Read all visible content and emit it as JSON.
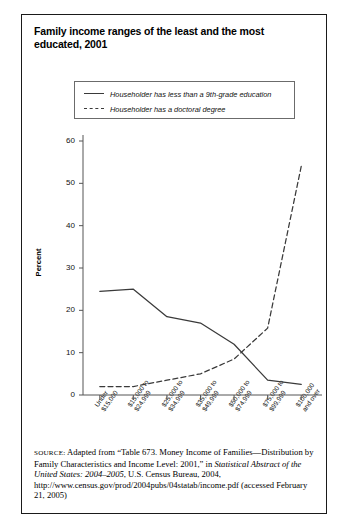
{
  "figure": {
    "title": "Family income ranges of the least and the most educated, 2001",
    "source_label": "SOURCE:",
    "source_part1": " Adapted from “Table 673. Money Income of Families—Distribution by Family Characteristics and Income Level: 2001,” in ",
    "source_italic": "Statistical Abstract of the United States: 2004–2005",
    "source_part2": ", U.S. Census Bureau, 2004, http://www.census.gov/prod/2004pubs/04statab/income.pdf (accessed February 21, 2005)"
  },
  "colors": {
    "line": "#3a3a3a",
    "axis": "#555555",
    "border": "#1a1a1a",
    "text": "#000000"
  },
  "chart_data": {
    "type": "line",
    "title": "Family income ranges of the least and the most educated, 2001",
    "xlabel": "",
    "ylabel": "Percent",
    "ylim": [
      0,
      60
    ],
    "yticks": [
      0,
      10,
      20,
      30,
      40,
      50,
      60
    ],
    "grid": false,
    "legend_position": "top-center",
    "categories": [
      "Under $15,000",
      "$15,000 to $24,999",
      "$25,000 to $34,999",
      "$35,000 to $49,999",
      "$50,000 to $74,999",
      "$75,000 to $99,999",
      "$100,000 and over"
    ],
    "category_lines": [
      [
        "Under",
        "$15,000"
      ],
      [
        "$15,000 to",
        "$24,999"
      ],
      [
        "$25,000 to",
        "$34,999"
      ],
      [
        "$35,000 to",
        "$49,999"
      ],
      [
        "$50,000 to",
        "$74,999"
      ],
      [
        "$75,000 to",
        "$99,999"
      ],
      [
        "$100,000",
        "and over"
      ]
    ],
    "series": [
      {
        "name": "Householder has less than a 9th-grade education",
        "style": "solid",
        "values": [
          24.5,
          25.0,
          18.5,
          17.0,
          12.0,
          3.5,
          2.5
        ]
      },
      {
        "name": "Householder has a doctoral degree",
        "style": "dashed",
        "values": [
          2.0,
          2.0,
          3.5,
          5.0,
          8.5,
          15.8,
          54.0
        ]
      }
    ]
  }
}
